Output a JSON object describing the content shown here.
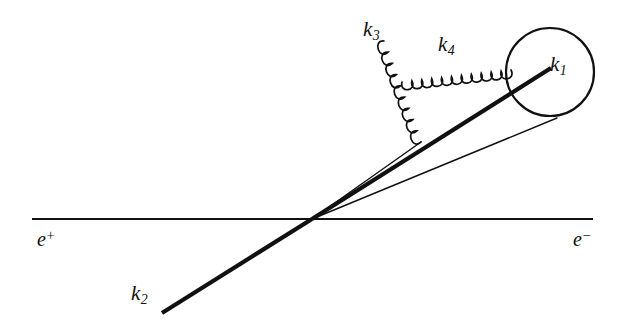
{
  "figure": {
    "kind": "feynman-diagram",
    "background_color": "#ffffff",
    "ink_color": "#111111",
    "width": 631,
    "height": 329
  },
  "labels": {
    "k1": {
      "symbol": "k",
      "subscript": "1",
      "x": 550,
      "y": 54
    },
    "k2": {
      "symbol": "k",
      "subscript": "2",
      "x": 131,
      "y": 283
    },
    "k3": {
      "symbol": "k",
      "subscript": "3",
      "x": 363,
      "y": 19
    },
    "k4": {
      "symbol": "k",
      "subscript": "4",
      "x": 438,
      "y": 34
    },
    "e_plus": {
      "symbol": "e",
      "superscript": "+",
      "x": 37,
      "y": 228
    },
    "e_minus": {
      "symbol": "e",
      "superscript": "−",
      "x": 573,
      "y": 228
    }
  },
  "geometry": {
    "vertex": {
      "x": 312,
      "y": 219
    },
    "beam_line": {
      "x1": 32,
      "y1": 219,
      "x2": 593,
      "y2": 219,
      "stroke_width": 2.2
    },
    "k2_line": {
      "x1": 162,
      "y1": 313,
      "x2": 312,
      "y2": 219,
      "stroke_width": 4.2
    },
    "k1_line": {
      "x1": 312,
      "y1": 219,
      "x2": 551,
      "y2": 68,
      "stroke_width": 4.2
    },
    "thin_line_upper": {
      "x1": 312,
      "y1": 219,
      "x2": 421,
      "y2": 142,
      "stroke_width": 1.4
    },
    "thin_line_lower": {
      "x1": 312,
      "y1": 219,
      "x2": 557,
      "y2": 118,
      "stroke_width": 1.4
    },
    "blob_circle": {
      "cx": 550,
      "cy": 72,
      "r": 44,
      "stroke_width": 2.2
    },
    "gluon_k3": {
      "x1": 384,
      "y1": 41,
      "x2": 421,
      "y2": 142,
      "coils": 9,
      "amplitude": 8.5
    },
    "gluon_k4": {
      "x1": 402,
      "y1": 82,
      "x2": 511,
      "y2": 70,
      "coils": 11,
      "amplitude": 8.5
    }
  },
  "chart_data": {
    "type": "diagram",
    "title": "",
    "elements": [
      {
        "name": "e+ incoming beam line",
        "role": "fermion-line",
        "from": [
          32,
          219
        ],
        "to": [
          312,
          219
        ]
      },
      {
        "name": "e- outgoing beam line",
        "role": "fermion-line",
        "from": [
          312,
          219
        ],
        "to": [
          593,
          219
        ]
      },
      {
        "name": "k2 outgoing parton",
        "role": "thick-momentum-line",
        "from": [
          162,
          313
        ],
        "to": [
          312,
          219
        ]
      },
      {
        "name": "k1 outgoing parton",
        "role": "thick-momentum-line",
        "from": [
          312,
          219
        ],
        "to": [
          551,
          68
        ]
      },
      {
        "name": "thin line to gluon emission vertex",
        "role": "thin-line",
        "from": [
          312,
          219
        ],
        "to": [
          421,
          142
        ]
      },
      {
        "name": "thin line to blob",
        "role": "thin-line",
        "from": [
          312,
          219
        ],
        "to": [
          557,
          118
        ]
      },
      {
        "name": "k3 gluon",
        "role": "gluon-spiral",
        "from": [
          384,
          41
        ],
        "to": [
          421,
          142
        ]
      },
      {
        "name": "k4 gluon",
        "role": "gluon-spiral",
        "from": [
          402,
          82
        ],
        "to": [
          511,
          70
        ]
      },
      {
        "name": "jet blob",
        "role": "circle",
        "center": [
          550,
          72
        ],
        "radius": 44
      }
    ]
  }
}
